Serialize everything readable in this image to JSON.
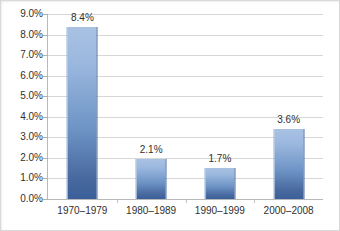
{
  "chart_data": {
    "type": "bar",
    "title": "",
    "subtitle": "",
    "xlabel": "",
    "ylabel": "",
    "categories": [
      "1970–1979",
      "1980–1989",
      "1990–1999",
      "2000–2008"
    ],
    "values": [
      8.4,
      2.1,
      1.7,
      3.6
    ],
    "data_labels": [
      "8.4%",
      "2.1%",
      "1.7%",
      "3.6%"
    ],
    "bar_plotted_values": [
      8.35,
      1.97,
      1.53,
      3.4
    ],
    "ylim": [
      0,
      9
    ],
    "ytick_step": 1,
    "ytick_labels": [
      "0.0%",
      "1.0%",
      "2.0%",
      "3.0%",
      "4.0%",
      "5.0%",
      "6.0%",
      "7.0%",
      "8.0%",
      "9.0%"
    ],
    "ytick_values": [
      0,
      1,
      2,
      3,
      4,
      5,
      6,
      7,
      8,
      9
    ],
    "grid": true,
    "grid_axis": "y",
    "legend": false,
    "legend_position": "none",
    "series": [
      {
        "name": "",
        "values": [
          8.4,
          2.1,
          1.7,
          3.6
        ]
      }
    ],
    "colors": {
      "bar_top": "#a9c2e3",
      "bar_bottom": "#3a5f99",
      "gridline": "#d7d7d7",
      "axis_line": "#b9b9b9",
      "text": "#2f2f2f",
      "background": "#ffffff",
      "frame": "#d9d9d9"
    }
  }
}
